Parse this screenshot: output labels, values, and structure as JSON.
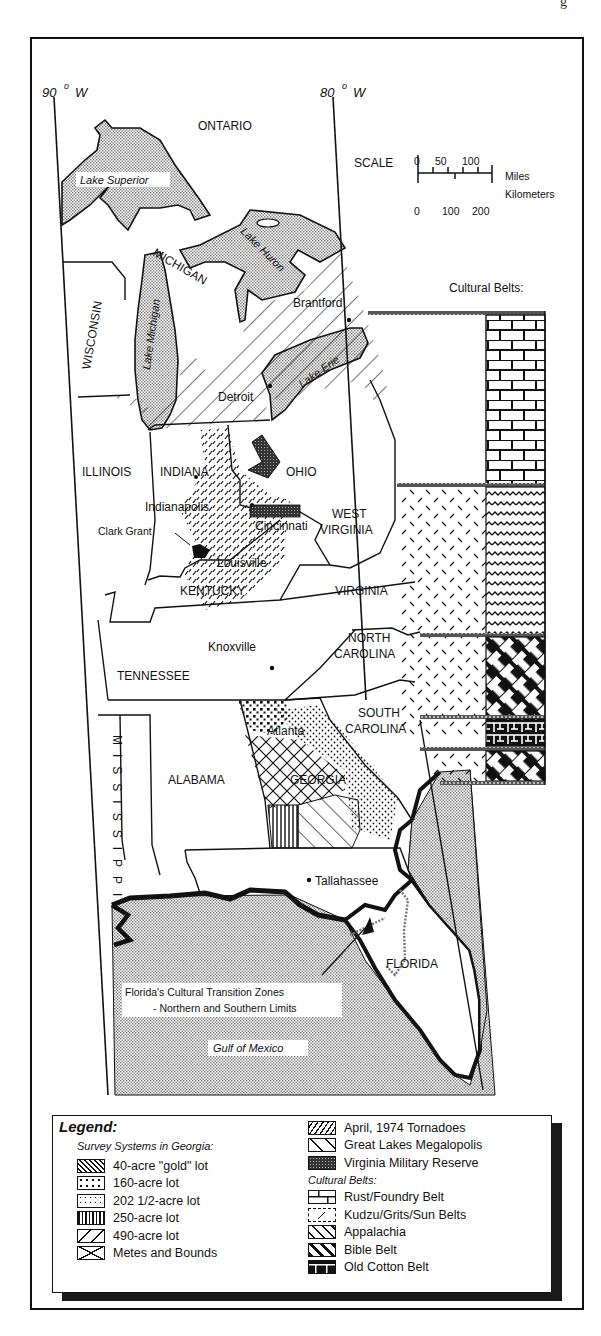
{
  "page_corner_text": "g",
  "map": {
    "meridians": [
      {
        "label": "90",
        "unit": "W",
        "degree_symbol": "o"
      },
      {
        "label": "80",
        "unit": "W",
        "degree_symbol": "o"
      }
    ],
    "scale": {
      "label": "SCALE",
      "miles_ticks": [
        "0",
        "50",
        "100"
      ],
      "km_ticks": [
        "0",
        "100",
        "200"
      ],
      "miles_label": "Miles",
      "km_label": "Kilometers"
    },
    "regions": {
      "ontario": "ONTARIO",
      "michigan": "MICHIGAN",
      "wisconsin": "WISCONSIN",
      "illinois": "ILLINOIS",
      "indiana": "INDIANA",
      "ohio": "OHIO",
      "west_virginia_1": "WEST",
      "west_virginia_2": "VIRGINIA",
      "kentucky": "KENTUCKY",
      "virginia": "VIRGINIA",
      "tennessee": "TENNESSEE",
      "north_carolina_1": "NORTH",
      "north_carolina_2": "CAROLINA",
      "south_carolina_1": "SOUTH",
      "south_carolina_2": "CAROLINA",
      "mississippi": "MISSISSIPPI",
      "alabama": "ALABAMA",
      "georgia": "GEORGIA",
      "florida": "FLORIDA"
    },
    "water": {
      "lake_superior": "Lake Superior",
      "lake_michigan": "Lake Michigan",
      "lake_huron": "Lake Huron",
      "lake_erie": "Lake Erie",
      "gulf_of_mexico": "Gulf of Mexico"
    },
    "cities": {
      "brantford": "Brantford",
      "detroit": "Detroit",
      "indianapolis": "Indianapolis",
      "cincinnati": "Cincinnati",
      "clark_grant": "Clark Grant",
      "louisville": "Louisville",
      "knoxville": "Knoxville",
      "atlanta": "Atlanta",
      "tallahassee": "Tallahassee"
    },
    "cultural_belts_heading": "Cultural Belts:",
    "annotation": {
      "line1": "Florida's Cultural Transition Zones",
      "line2": "- Northern and Southern Limits"
    }
  },
  "legend": {
    "title": "Legend:",
    "survey_heading": "Survey Systems in Georgia:",
    "survey_items": [
      {
        "label": "40-acre \"gold\" lot",
        "pattern": "diag-back-dense"
      },
      {
        "label": "160-acre lot",
        "pattern": "large-dots"
      },
      {
        "label": "202 1/2-acre lot",
        "pattern": "small-dots"
      },
      {
        "label": "250-acre lot",
        "pattern": "vertical-lines"
      },
      {
        "label": "490-acre lot",
        "pattern": "diag-forward-sparse"
      },
      {
        "label": "Metes and Bounds",
        "pattern": "crosshatch"
      }
    ],
    "other_items": [
      {
        "label": "April, 1974 Tornadoes",
        "pattern": "dashed-diagonal"
      },
      {
        "label": "Great Lakes Megalopolis",
        "pattern": "diag-back-sparse"
      },
      {
        "label": "Virginia Military Reserve",
        "pattern": "dark-stipple"
      }
    ],
    "belts_heading": "Cultural Belts:",
    "belt_items": [
      {
        "label": "Rust/Foundry Belt",
        "pattern": "brick"
      },
      {
        "label": "Kudzu/Grits/Sun Belts",
        "pattern": "dashes"
      },
      {
        "label": "Appalachia",
        "pattern": "waves"
      },
      {
        "label": "Bible Belt",
        "pattern": "weave"
      },
      {
        "label": "Old Cotton Belt",
        "pattern": "dark-lattice"
      }
    ]
  },
  "colors": {
    "ink": "#111111",
    "paper": "#ffffff",
    "water_stipple": "#bdbdbd"
  }
}
